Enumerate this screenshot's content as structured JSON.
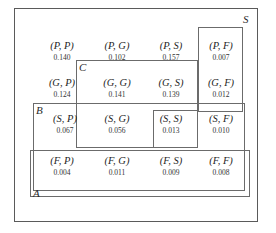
{
  "diagram": {
    "type": "venn-rectangles",
    "background_color": "#ffffff",
    "line_color": "#6b6b6b",
    "text_color": "#1f1f1f"
  },
  "sets": [
    {
      "id": "S",
      "label": "S",
      "label_x": 243,
      "label_y": 14,
      "x": 14,
      "y": 8,
      "w": 244,
      "h": 214
    },
    {
      "id": "F-column",
      "label": "",
      "x": 198,
      "y": 27,
      "w": 45,
      "h": 85
    },
    {
      "id": "C",
      "label": "C",
      "label_x": 79,
      "label_y": 62,
      "x": 76,
      "y": 60,
      "w": 122,
      "h": 88
    },
    {
      "id": "B",
      "label": "B",
      "label_x": 36,
      "label_y": 105,
      "x": 33,
      "y": 103,
      "w": 212,
      "h": 88
    },
    {
      "id": "SS",
      "label": "",
      "x": 153,
      "y": 110,
      "w": 45,
      "h": 38
    },
    {
      "id": "A",
      "label": "A",
      "label_x": 33,
      "label_y": 188,
      "x": 30,
      "y": 150,
      "w": 220,
      "h": 47
    }
  ],
  "chart_data": {
    "type": "table",
    "row_labels": [
      "P",
      "G",
      "S",
      "F"
    ],
    "col_labels": [
      "P",
      "G",
      "S",
      "F"
    ],
    "cells": [
      {
        "pair": "(P, P)",
        "prob": "0.140",
        "value": 0.14,
        "row": 0,
        "col": 0,
        "x": 34,
        "y": 40
      },
      {
        "pair": "(P, G)",
        "prob": "0.102",
        "value": 0.102,
        "row": 0,
        "col": 1,
        "x": 89,
        "y": 40
      },
      {
        "pair": "(P, S)",
        "prob": "0.157",
        "value": 0.157,
        "row": 0,
        "col": 2,
        "x": 143,
        "y": 40
      },
      {
        "pair": "(P, F)",
        "prob": "0.007",
        "value": 0.007,
        "row": 0,
        "col": 3,
        "x": 193,
        "y": 40
      },
      {
        "pair": "(G, P)",
        "prob": "0.124",
        "value": 0.124,
        "row": 1,
        "col": 0,
        "x": 34,
        "y": 77
      },
      {
        "pair": "(G, G)",
        "prob": "0.141",
        "value": 0.141,
        "row": 1,
        "col": 1,
        "x": 89,
        "y": 77
      },
      {
        "pair": "(G, S)",
        "prob": "0.139",
        "value": 0.139,
        "row": 1,
        "col": 2,
        "x": 143,
        "y": 77
      },
      {
        "pair": "(G, F)",
        "prob": "0.012",
        "value": 0.012,
        "row": 1,
        "col": 3,
        "x": 193,
        "y": 77
      },
      {
        "pair": "(S, P)",
        "prob": "0.067",
        "value": 0.067,
        "row": 2,
        "col": 0,
        "x": 37,
        "y": 113
      },
      {
        "pair": "(S, G)",
        "prob": "0.056",
        "value": 0.056,
        "row": 2,
        "col": 1,
        "x": 89,
        "y": 113
      },
      {
        "pair": "(S, S)",
        "prob": "0.013",
        "value": 0.013,
        "row": 2,
        "col": 2,
        "x": 143,
        "y": 113
      },
      {
        "pair": "(S, F)",
        "prob": "0.010",
        "value": 0.01,
        "row": 2,
        "col": 3,
        "x": 193,
        "y": 113
      },
      {
        "pair": "(F, P)",
        "prob": "0.004",
        "value": 0.004,
        "row": 3,
        "col": 0,
        "x": 34,
        "y": 155
      },
      {
        "pair": "(F, G)",
        "prob": "0.011",
        "value": 0.011,
        "row": 3,
        "col": 1,
        "x": 89,
        "y": 155
      },
      {
        "pair": "(F, S)",
        "prob": "0.009",
        "value": 0.009,
        "row": 3,
        "col": 2,
        "x": 143,
        "y": 155
      },
      {
        "pair": "(F, F)",
        "prob": "0.008",
        "value": 0.008,
        "row": 3,
        "col": 3,
        "x": 193,
        "y": 155
      }
    ]
  }
}
